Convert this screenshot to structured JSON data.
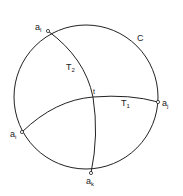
{
  "diagram": {
    "circle": {
      "label": "C",
      "cx": 86,
      "cy": 96,
      "r": 72
    },
    "points": [
      {
        "id": "al",
        "base": "a",
        "sub": "l",
        "x": 48,
        "y": 31
      },
      {
        "id": "aj",
        "base": "a",
        "sub": "j",
        "x": 158,
        "y": 102
      },
      {
        "id": "ai",
        "base": "a",
        "sub": "i",
        "x": 22,
        "y": 132
      },
      {
        "id": "ak",
        "base": "a",
        "sub": "k",
        "x": 91,
        "y": 173
      }
    ],
    "intersection": {
      "label": "t",
      "x": 93,
      "y": 97
    },
    "arcs": [
      {
        "id": "T1",
        "base": "T",
        "sub": "1",
        "from": "ai",
        "to": "aj"
      },
      {
        "id": "T2",
        "base": "T",
        "sub": "2",
        "from": "al",
        "to": "ak"
      }
    ]
  },
  "labels": {
    "C": "C",
    "al_base": "a",
    "al_sub": "l",
    "aj_base": "a",
    "aj_sub": "j",
    "ai_base": "a",
    "ai_sub": "i",
    "ak_base": "a",
    "ak_sub": "k",
    "t": "t",
    "T1_base": "T",
    "T1_sub": "1",
    "T2_base": "T",
    "T2_sub": "2"
  },
  "colors": {
    "stroke": "#222222",
    "background": "#ffffff"
  }
}
